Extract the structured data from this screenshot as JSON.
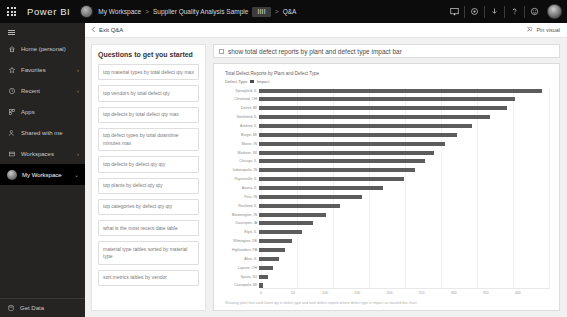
{
  "topbar": {
    "waffle_icon": "waffle-grid-icon",
    "brand": "Power BI",
    "breadcrumb": {
      "workspace": "My Workspace",
      "sep1": ">",
      "report": "Supplier Quality Analysis Sample",
      "chip": "IIII",
      "sep2": ">",
      "page": "Q&A"
    },
    "icons": [
      "present-icon",
      "settings-gear-icon",
      "download-icon",
      "help-question-icon",
      "feedback-smiley-icon"
    ],
    "avatar": "user-avatar"
  },
  "sidebar": {
    "hamburger": "hamburger-icon",
    "items": [
      {
        "label": "Home (personal)",
        "icon": "home-icon",
        "chevron": "",
        "active": false
      },
      {
        "label": "Favorites",
        "icon": "star-icon",
        "chevron": "›",
        "active": false
      },
      {
        "label": "Recent",
        "icon": "clock-icon",
        "chevron": "›",
        "active": false
      },
      {
        "label": "Apps",
        "icon": "apps-icon",
        "chevron": "",
        "active": false
      },
      {
        "label": "Shared with me",
        "icon": "share-people-icon",
        "chevron": "",
        "active": false
      },
      {
        "label": "Workspaces",
        "icon": "workspace-icon",
        "chevron": "›",
        "active": false
      },
      {
        "label": "My Workspace",
        "icon": "user-avatar-icon",
        "chevron": "⌄",
        "active": true
      }
    ],
    "get_data": {
      "label": "Get Data",
      "icon": "get-data-icon"
    }
  },
  "qabar": {
    "exit_label": "Exit Q&A",
    "exit_icon": "chevron-left-icon",
    "pin_label": "Pin visual",
    "pin_icon": "pin-icon"
  },
  "questions_pane": {
    "title": "Questions to get you started",
    "items": [
      "top material types by total defect qty max",
      "top vendors by total defect qty",
      "top defects by total defect qty max",
      "top defect types by total downtime minutes max",
      "top defects by defect qty qty",
      "top plants by defect qty qty",
      "top categories by defect qty qty",
      "what is the most recent date table",
      "material type tables sorted by material type",
      "sort metrics tables by vendor"
    ]
  },
  "query": {
    "text": "show total defect reports by plant and defect type impact bar",
    "checkbox_icon": "checkbox-icon"
  },
  "chart_data": {
    "type": "bar",
    "orientation": "horizontal",
    "title": "Total Defect Reports by Plant and Defect Type",
    "legend_title": "Defect Type",
    "legend_entries": [
      "Impact"
    ],
    "legend_position": "top-left",
    "xlabel": "",
    "ylabel": "",
    "xlim": [
      0,
      400
    ],
    "xticks": [
      0,
      50,
      100,
      150,
      200,
      250,
      300,
      350,
      400
    ],
    "grid": true,
    "categories": [
      "Springfield, IL",
      "Cleveland, OH",
      "Detroit, MI",
      "Smithfield, IL",
      "Ashford, IL",
      "Burgin, MI",
      "Moore, IN",
      "Madison, WI",
      "Chicago, IL",
      "Indianapolis, IN",
      "Paynesville, IL",
      "Aurora, IL",
      "Peru, IN",
      "Rockford, IL",
      "Bloomington, IN",
      "Davenport, IA",
      "Elgin, IL",
      "Wilmington, DE",
      "Highlandton, PA",
      "Alton, IL",
      "Laporte, OH",
      "Sparta, NJ",
      "Cassopolis, MI"
    ],
    "values": [
      389,
      352,
      341,
      318,
      293,
      272,
      256,
      241,
      228,
      214,
      199,
      170,
      141,
      112,
      92,
      74,
      59,
      46,
      36,
      27,
      19,
      12,
      6
    ],
    "series_name": "Total Defect Reports",
    "footer": "Showing plant that used latest qty in defect type and total defect reports where defect type is impact as stacked bar chart"
  }
}
